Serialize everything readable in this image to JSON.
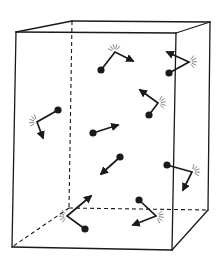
{
  "figure": {
    "title": "Gas molecules in a box colliding with walls",
    "colors": {
      "line": "#1a1a1a",
      "spark": "#555555",
      "background": "#ffffff"
    }
  },
  "box": {
    "front": {
      "tl": [
        16,
        32
      ],
      "tr": [
        176,
        33
      ],
      "br": [
        172,
        250
      ],
      "bl": [
        12,
        247
      ]
    },
    "back": {
      "tl": [
        72,
        21
      ],
      "tr": [
        210,
        22
      ],
      "br": [
        208,
        210
      ],
      "bl": [
        69,
        208
      ]
    }
  },
  "molecules": [
    {
      "id": "m1",
      "start": [
        101,
        70
      ],
      "bounce": [
        115,
        52
      ],
      "end": [
        133,
        61
      ],
      "collision": true
    },
    {
      "id": "m2",
      "start": [
        169,
        73
      ],
      "bounce": [
        189,
        62
      ],
      "end": [
        167,
        52
      ],
      "collision": true
    },
    {
      "id": "m3",
      "start": [
        149,
        115
      ],
      "bounce": [
        158,
        103
      ],
      "end": [
        140,
        90
      ],
      "collision": true
    },
    {
      "id": "m4",
      "start": [
        58,
        110
      ],
      "bounce": [
        37,
        122
      ],
      "end": [
        43,
        138
      ],
      "collision": true
    },
    {
      "id": "m5",
      "start": [
        93,
        133
      ],
      "bounce": null,
      "end": [
        118,
        125
      ],
      "collision": false
    },
    {
      "id": "m6",
      "start": [
        120,
        157
      ],
      "bounce": null,
      "end": [
        101,
        174
      ],
      "collision": false
    },
    {
      "id": "m7",
      "start": [
        167,
        165
      ],
      "bounce": [
        192,
        172
      ],
      "end": [
        183,
        190
      ],
      "collision": true
    },
    {
      "id": "m8",
      "start": [
        85,
        229
      ],
      "bounce": [
        67,
        216
      ],
      "end": [
        91,
        196
      ],
      "collision": true
    },
    {
      "id": "m9",
      "start": [
        139,
        200
      ],
      "bounce": [
        156,
        216
      ],
      "end": [
        133,
        225
      ],
      "collision": true
    }
  ]
}
